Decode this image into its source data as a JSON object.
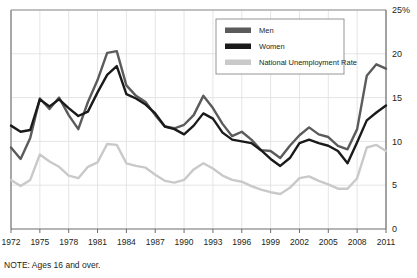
{
  "chart_data": {
    "type": "line",
    "title": "",
    "subtitle": "",
    "xlabel": "",
    "ylabel": "",
    "note": "NOTE: Ages 16 and over.",
    "grid": true,
    "legend_position": "top-right",
    "xlim": [
      1972,
      2011
    ],
    "ylim": [
      0,
      25
    ],
    "yticks": [
      0,
      5,
      10,
      15,
      20,
      25
    ],
    "ytick_labels": [
      "0",
      "5",
      "10",
      "15",
      "20",
      "25%"
    ],
    "xticks": [
      1972,
      1975,
      1978,
      1981,
      1984,
      1987,
      1990,
      1993,
      1996,
      1999,
      2002,
      2005,
      2008,
      2011
    ],
    "xtick_labels": [
      "1972",
      "1975",
      "1978",
      "1981",
      "1984",
      "1987",
      "1990",
      "1993",
      "1996",
      "1999",
      "2002",
      "2005",
      "2008",
      "2011"
    ],
    "x": [
      1972,
      1973,
      1974,
      1975,
      1976,
      1977,
      1978,
      1979,
      1980,
      1981,
      1982,
      1983,
      1984,
      1985,
      1986,
      1987,
      1988,
      1989,
      1990,
      1991,
      1992,
      1993,
      1994,
      1995,
      1996,
      1997,
      1998,
      1999,
      2000,
      2001,
      2002,
      2003,
      2004,
      2005,
      2006,
      2007,
      2008,
      2009,
      2010,
      2011
    ],
    "series": [
      {
        "name": "Men",
        "color": "#5b5b5b",
        "values": [
          9.3,
          8.0,
          10.4,
          14.9,
          13.7,
          15.0,
          13.0,
          11.4,
          14.5,
          17.0,
          20.1,
          20.3,
          16.4,
          15.2,
          14.5,
          13.0,
          11.7,
          11.5,
          11.9,
          13.0,
          15.2,
          13.8,
          12.0,
          10.6,
          11.1,
          10.2,
          9.0,
          8.9,
          8.1,
          9.5,
          10.7,
          11.6,
          10.8,
          10.5,
          9.5,
          9.1,
          11.4,
          17.5,
          18.8,
          18.3
        ]
      },
      {
        "name": "Women",
        "color": "#1a1a1a",
        "values": [
          11.8,
          11.1,
          11.3,
          14.8,
          14.0,
          14.8,
          13.8,
          12.9,
          13.4,
          15.6,
          17.6,
          18.6,
          15.4,
          14.9,
          14.2,
          13.2,
          11.7,
          11.4,
          10.8,
          11.8,
          13.2,
          12.6,
          11.0,
          10.2,
          10.0,
          9.8,
          9.0,
          8.0,
          7.2,
          8.1,
          9.8,
          10.2,
          9.8,
          9.5,
          8.9,
          7.5,
          9.9,
          12.4,
          13.3,
          14.1
        ]
      },
      {
        "name": "National Unemployment Rate",
        "color": "#c9c9c9",
        "values": [
          5.6,
          4.9,
          5.6,
          8.5,
          7.7,
          7.1,
          6.1,
          5.8,
          7.1,
          7.6,
          9.7,
          9.6,
          7.5,
          7.2,
          7.0,
          6.2,
          5.5,
          5.3,
          5.6,
          6.8,
          7.5,
          6.9,
          6.1,
          5.6,
          5.4,
          4.9,
          4.5,
          4.2,
          4.0,
          4.7,
          5.8,
          6.0,
          5.5,
          5.1,
          4.6,
          4.6,
          5.8,
          9.3,
          9.6,
          8.9
        ]
      }
    ],
    "legend": [
      {
        "label": "Men",
        "color": "#5b5b5b"
      },
      {
        "label": "Women",
        "color": "#1a1a1a"
      },
      {
        "label": "National Unemployment Rate",
        "color": "#c9c9c9"
      }
    ],
    "axis_color": "#6d6d6d",
    "grid_color": "#e2e2e2"
  }
}
